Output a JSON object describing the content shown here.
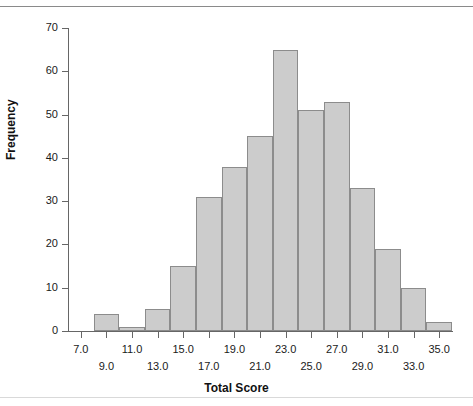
{
  "chart_data": {
    "type": "bar",
    "title": "",
    "subtitle": "",
    "xlabel": "Total Score",
    "ylabel": "Frequency",
    "xlim": [
      6,
      36
    ],
    "ylim": [
      0,
      70
    ],
    "ytick_step": 10,
    "xtick_step": 2,
    "grid": false,
    "legend": null,
    "bin_width": 2,
    "categories": [
      "9.0",
      "11.0",
      "13.0",
      "15.0",
      "17.0",
      "19.0",
      "21.0",
      "23.0",
      "25.0",
      "27.0",
      "29.0",
      "31.0",
      "33.0",
      "35.0"
    ],
    "bin_edges": [
      8,
      10,
      12,
      14,
      16,
      18,
      20,
      22,
      24,
      26,
      28,
      30,
      32,
      34,
      36
    ],
    "values": [
      4,
      1,
      5,
      15,
      31,
      38,
      45,
      65,
      51,
      53,
      33,
      19,
      10,
      2
    ],
    "ytick_labels": [
      "0",
      "10",
      "20",
      "30",
      "40",
      "50",
      "60",
      "70"
    ],
    "ytick_values": [
      0,
      10,
      20,
      30,
      40,
      50,
      60,
      70
    ],
    "xtick_values": [
      7,
      9,
      11,
      13,
      15,
      17,
      19,
      21,
      23,
      25,
      27,
      29,
      31,
      33,
      35
    ],
    "xtick_labels_row1": [
      "7.0",
      "11.0",
      "15.0",
      "19.0",
      "23.0",
      "27.0",
      "31.0",
      "35.0"
    ],
    "xtick_labels_row2": [
      "9.0",
      "13.0",
      "17.0",
      "21.0",
      "25.0",
      "29.0",
      "33.0"
    ],
    "xtick_row1_values": [
      7,
      11,
      15,
      19,
      23,
      27,
      31,
      35
    ],
    "xtick_row2_values": [
      9,
      13,
      17,
      21,
      25,
      29,
      33
    ],
    "colors": {
      "bar_fill": "#cccccc",
      "bar_stroke": "#8c8c8c",
      "axis": "#666666",
      "text": "#1a1a1a"
    }
  }
}
